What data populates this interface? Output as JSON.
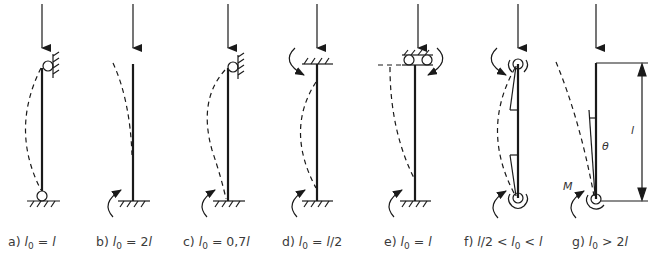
{
  "figure": {
    "cases": [
      {
        "id": "a",
        "prefix": "a) ",
        "formula": "l0 = l",
        "display": [
          "l",
          "0",
          " = ",
          "l",
          ""
        ]
      },
      {
        "id": "b",
        "prefix": "b) ",
        "formula": "l0 = 2l",
        "display": [
          "l",
          "0",
          " = 2",
          "l",
          ""
        ]
      },
      {
        "id": "c",
        "prefix": "c) ",
        "formula": "l0 = 0,7l",
        "display": [
          "l",
          "0",
          " = 0,7",
          "l",
          ""
        ]
      },
      {
        "id": "d",
        "prefix": "d) ",
        "formula": "l0 = l/2",
        "display": [
          "l",
          "0",
          " = ",
          "l",
          "/2"
        ]
      },
      {
        "id": "e",
        "prefix": "e) ",
        "formula": "l0 = l",
        "display": [
          "l",
          "0",
          " = ",
          "l",
          ""
        ]
      },
      {
        "id": "f",
        "prefix": "f) ",
        "formula": "l/2 < l0 < l"
      },
      {
        "id": "g",
        "prefix": "g) ",
        "formula": "l0 > 2l",
        "display": [
          "l",
          "0",
          " > 2",
          "l",
          ""
        ]
      }
    ],
    "annotations": {
      "length_symbol": "l",
      "angle_symbol": "θ",
      "moment_symbol": "M"
    }
  }
}
